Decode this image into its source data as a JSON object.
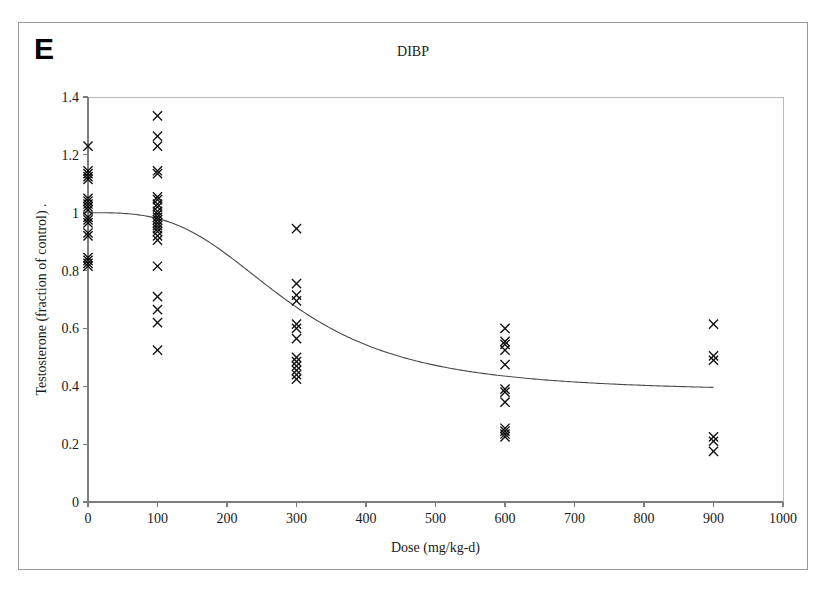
{
  "figure": {
    "panel_letter": "E",
    "title": "DIBP"
  },
  "chart_data": {
    "type": "scatter",
    "title": "DIBP",
    "xlabel": "Dose (mg/kg-d)",
    "ylabel": "Testosterone (fraction of control) .",
    "xlim": [
      0,
      1000
    ],
    "ylim": [
      0,
      1.4
    ],
    "xticks": [
      0,
      100,
      200,
      300,
      400,
      500,
      600,
      700,
      800,
      900,
      1000
    ],
    "xtick_labels": [
      "0",
      "100",
      "200",
      "300",
      "400",
      "500",
      "600",
      "700",
      "800",
      "900",
      "1000"
    ],
    "yticks": [
      0,
      0.2,
      0.4,
      0.6,
      0.8,
      1,
      1.2,
      1.4
    ],
    "ytick_labels": [
      "0",
      "0.2",
      "0.4",
      "0.6",
      "0.8",
      "1",
      "1.2",
      "1.4"
    ],
    "grid": false,
    "legend": "none",
    "marker": "x",
    "series": [
      {
        "name": "Testosterone observations",
        "marker": "x",
        "points": [
          [
            0,
            1.23
          ],
          [
            0,
            1.145
          ],
          [
            0,
            1.135
          ],
          [
            0,
            1.125
          ],
          [
            0,
            1.115
          ],
          [
            0,
            1.05
          ],
          [
            0,
            1.04
          ],
          [
            0,
            1.03
          ],
          [
            0,
            1.02
          ],
          [
            0,
            1.01
          ],
          [
            0,
            0.985
          ],
          [
            0,
            0.975
          ],
          [
            0,
            0.965
          ],
          [
            0,
            0.93
          ],
          [
            0,
            0.92
          ],
          [
            0,
            0.845
          ],
          [
            0,
            0.835
          ],
          [
            0,
            0.825
          ],
          [
            0,
            0.815
          ]
        ]
      },
      {
        "name": "Testosterone observations (100 mg/kg-d)",
        "marker": "x",
        "points": [
          [
            100,
            1.335
          ],
          [
            100,
            1.265
          ],
          [
            100,
            1.23
          ],
          [
            100,
            1.145
          ],
          [
            100,
            1.135
          ],
          [
            100,
            1.055
          ],
          [
            100,
            1.045
          ],
          [
            100,
            1.03
          ],
          [
            100,
            1.02
          ],
          [
            100,
            1.005
          ],
          [
            100,
            0.995
          ],
          [
            100,
            0.985
          ],
          [
            100,
            0.975
          ],
          [
            100,
            0.965
          ],
          [
            100,
            0.955
          ],
          [
            100,
            0.945
          ],
          [
            100,
            0.935
          ],
          [
            100,
            0.92
          ],
          [
            100,
            0.905
          ],
          [
            100,
            0.815
          ],
          [
            100,
            0.71
          ],
          [
            100,
            0.665
          ],
          [
            100,
            0.62
          ],
          [
            100,
            0.525
          ]
        ]
      },
      {
        "name": "Testosterone observations (300 mg/kg-d)",
        "marker": "x",
        "points": [
          [
            300,
            0.945
          ],
          [
            300,
            0.755
          ],
          [
            300,
            0.715
          ],
          [
            300,
            0.695
          ],
          [
            300,
            0.615
          ],
          [
            300,
            0.6
          ],
          [
            300,
            0.565
          ],
          [
            300,
            0.5
          ],
          [
            300,
            0.485
          ],
          [
            300,
            0.47
          ],
          [
            300,
            0.455
          ],
          [
            300,
            0.44
          ],
          [
            300,
            0.425
          ]
        ]
      },
      {
        "name": "Testosterone observations (600 mg/kg-d)",
        "marker": "x",
        "points": [
          [
            600,
            0.6
          ],
          [
            600,
            0.555
          ],
          [
            600,
            0.545
          ],
          [
            600,
            0.525
          ],
          [
            600,
            0.475
          ],
          [
            600,
            0.39
          ],
          [
            600,
            0.38
          ],
          [
            600,
            0.345
          ],
          [
            600,
            0.255
          ],
          [
            600,
            0.245
          ],
          [
            600,
            0.235
          ],
          [
            600,
            0.225
          ]
        ]
      },
      {
        "name": "Testosterone observations (900 mg/kg-d)",
        "marker": "x",
        "points": [
          [
            900,
            0.615
          ],
          [
            900,
            0.505
          ],
          [
            900,
            0.49
          ],
          [
            900,
            0.225
          ],
          [
            900,
            0.21
          ],
          [
            900,
            0.175
          ]
        ]
      }
    ],
    "fit_curve": {
      "name": "Fitted dose-response curve",
      "model": "sigmoid",
      "top": 1.0,
      "bottom": 0.38,
      "ed50": 290,
      "hill_slope": 3.2,
      "x_start": 0,
      "x_end": 900
    }
  }
}
